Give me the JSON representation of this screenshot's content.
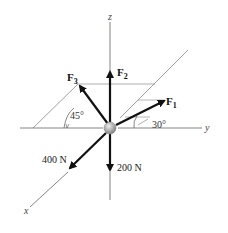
{
  "diagram": {
    "type": "3D force system on a particle",
    "axes": {
      "x_label": "x",
      "y_label": "y",
      "z_label": "z"
    },
    "forces": {
      "F1": {
        "label_main": "F",
        "label_sub": "1",
        "angle_label": "30°"
      },
      "F2": {
        "label_main": "F",
        "label_sub": "2"
      },
      "F3": {
        "label_main": "F",
        "label_sub": "3",
        "angle_label": "45°"
      },
      "f400": {
        "label": "400 N"
      },
      "f200": {
        "label": "200 N"
      }
    },
    "colors": {
      "line": "#333333",
      "thin": "#777777",
      "plane": "#999999",
      "ball": "#b8b8b8"
    }
  }
}
